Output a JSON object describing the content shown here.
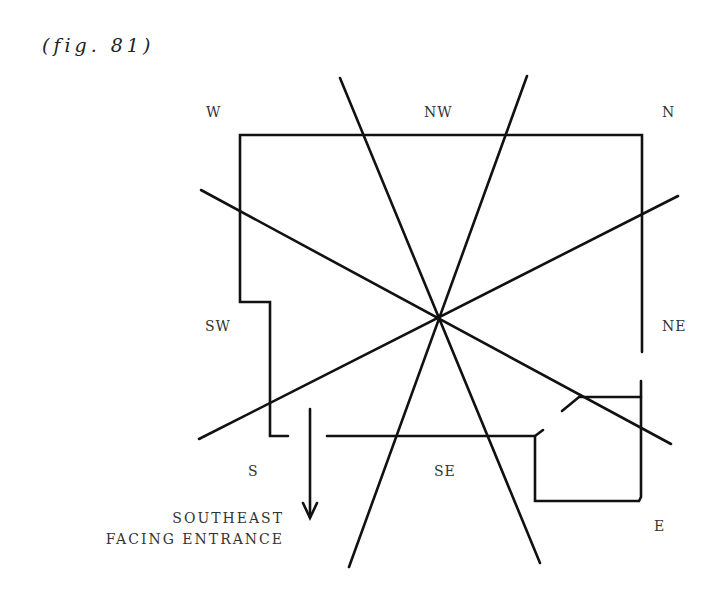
{
  "caption": "(fig. 81)",
  "directions": {
    "w": "W",
    "nw": "NW",
    "n": "N",
    "sw": "SW",
    "ne": "NE",
    "s": "S",
    "se": "SE",
    "e": "E"
  },
  "entrance": {
    "line1": "SOUTHEAST",
    "line2": "FACING ENTRANCE"
  },
  "colors": {
    "ink": "#111111",
    "background": "#ffffff"
  }
}
